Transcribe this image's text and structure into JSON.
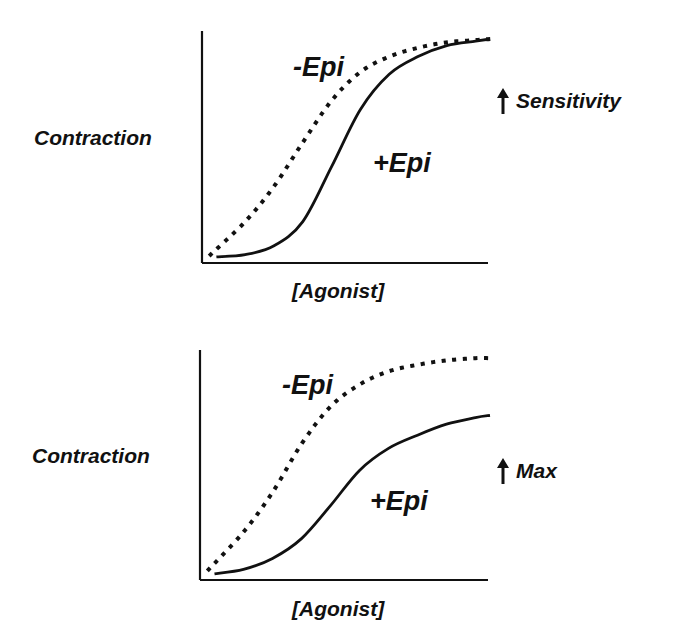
{
  "panels": [
    {
      "ylabel": "Contraction",
      "xlabel": "[Agonist]",
      "curve_minus_label": "-Epi",
      "curve_plus_label": "+Epi",
      "effect_label": "Sensitivity",
      "effect_icon": "up-arrow-icon"
    },
    {
      "ylabel": "Contraction",
      "xlabel": "[Agonist]",
      "curve_minus_label": "-Epi",
      "curve_plus_label": "+Epi",
      "effect_label": "Max",
      "effect_icon": "up-arrow-icon"
    }
  ],
  "chart_data": [
    {
      "type": "line",
      "title": "",
      "xlabel": "[Agonist]",
      "ylabel": "Contraction",
      "annotation": "↑ Sensitivity",
      "xlim": [
        0,
        1
      ],
      "ylim": [
        0,
        1
      ],
      "grid": false,
      "series": [
        {
          "name": "-Epi",
          "style": "dotted",
          "x": [
            0.03,
            0.15,
            0.25,
            0.35,
            0.45,
            0.55,
            0.65,
            0.75,
            0.85,
            0.95,
            1.0
          ],
          "y": [
            0.02,
            0.17,
            0.33,
            0.53,
            0.72,
            0.85,
            0.92,
            0.96,
            0.985,
            0.995,
            1.0
          ]
        },
        {
          "name": "+Epi",
          "style": "solid",
          "x": [
            0.05,
            0.15,
            0.25,
            0.35,
            0.45,
            0.55,
            0.65,
            0.75,
            0.85,
            0.95,
            1.0
          ],
          "y": [
            0.01,
            0.02,
            0.06,
            0.17,
            0.42,
            0.68,
            0.84,
            0.92,
            0.97,
            0.99,
            1.0
          ]
        }
      ]
    },
    {
      "type": "line",
      "title": "",
      "xlabel": "[Agonist]",
      "ylabel": "Contraction",
      "annotation": "↑ Max",
      "xlim": [
        0,
        1
      ],
      "ylim": [
        0,
        1
      ],
      "grid": false,
      "series": [
        {
          "name": "-Epi",
          "style": "dotted",
          "x": [
            0.03,
            0.15,
            0.25,
            0.35,
            0.45,
            0.55,
            0.65,
            0.75,
            0.85,
            0.95,
            1.0
          ],
          "y": [
            0.03,
            0.2,
            0.38,
            0.6,
            0.77,
            0.87,
            0.93,
            0.96,
            0.98,
            0.99,
            0.99
          ]
        },
        {
          "name": "+Epi",
          "style": "solid",
          "x": [
            0.05,
            0.15,
            0.25,
            0.35,
            0.45,
            0.55,
            0.65,
            0.75,
            0.85,
            0.95,
            1.0
          ],
          "y": [
            0.01,
            0.03,
            0.08,
            0.17,
            0.32,
            0.48,
            0.58,
            0.64,
            0.69,
            0.72,
            0.73
          ]
        }
      ]
    }
  ]
}
